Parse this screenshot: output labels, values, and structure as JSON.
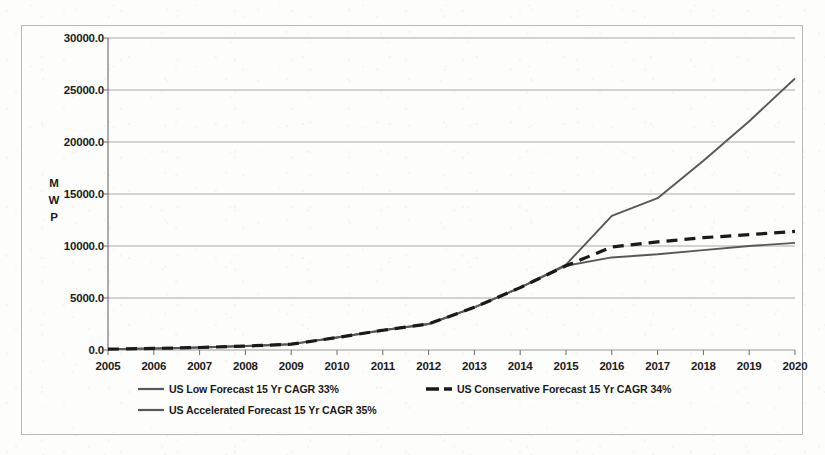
{
  "chart_data": {
    "type": "line",
    "title": "",
    "xlabel": "",
    "ylabel": "MWP",
    "ylabel_chars": [
      "M",
      "W",
      "P"
    ],
    "categories": [
      2005,
      2006,
      2007,
      2008,
      2009,
      2010,
      2011,
      2012,
      2013,
      2014,
      2015,
      2016,
      2017,
      2018,
      2019,
      2020
    ],
    "x_tick_labels": [
      "2005",
      "2006",
      "2007",
      "2008",
      "2009",
      "2010",
      "2011",
      "2012",
      "2013",
      "2014",
      "2015",
      "2016",
      "2017",
      "2018",
      "2019",
      "2020"
    ],
    "y_tick_labels": [
      "0.0",
      "5000.0",
      "10000.0",
      "15000.0",
      "20000.0",
      "25000.0",
      "30000.0"
    ],
    "y_tick_values": [
      0,
      5000,
      10000,
      15000,
      20000,
      25000,
      30000
    ],
    "ylim": [
      0,
      30000
    ],
    "grid": "horizontal",
    "legend_position": "bottom",
    "series": [
      {
        "name": "US Low Forecast 15 Yr CAGR 33%",
        "style": "solid",
        "color": "#585858",
        "values": [
          80,
          150,
          240,
          380,
          560,
          1200,
          1900,
          2500,
          4100,
          6000,
          8100,
          8900,
          9200,
          9600,
          10000,
          10300
        ]
      },
      {
        "name": "US Conservative Forecast 15 Yr CAGR 34%",
        "style": "dashed",
        "color": "#1a1a1a",
        "values": [
          80,
          150,
          240,
          380,
          560,
          1200,
          1900,
          2500,
          4100,
          6000,
          8100,
          9900,
          10400,
          10800,
          11100,
          11400
        ]
      },
      {
        "name": "US Accelerated Forecast 15 Yr CAGR 35%",
        "style": "solid",
        "color": "#585858",
        "values": [
          80,
          150,
          240,
          380,
          560,
          1200,
          1900,
          2500,
          4100,
          6000,
          8200,
          12900,
          14600,
          18200,
          22000,
          26100
        ]
      }
    ]
  },
  "legend": {
    "items": [
      {
        "label": "US Low Forecast 15 Yr CAGR 33%",
        "style": "solid"
      },
      {
        "label": "US Conservative Forecast 15 Yr CAGR 34%",
        "style": "dashed"
      },
      {
        "label": "US Accelerated Forecast 15 Yr CAGR 35%",
        "style": "solid"
      }
    ]
  },
  "colors": {
    "gridline": "#9a9a9f",
    "axis": "#6a6a6e",
    "frame": "#b9b9bc",
    "line_gray": "#585858",
    "line_dark": "#1a1a1a",
    "background": "#fdfdfc"
  }
}
